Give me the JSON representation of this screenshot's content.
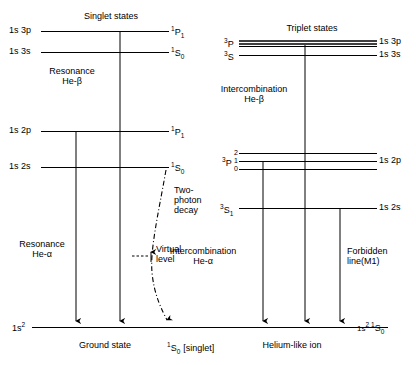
{
  "figure": {
    "type": "energy-level-diagram",
    "subject": "Helium-like ion",
    "columns": [
      {
        "name": "singlet",
        "heading": "Singlet states"
      },
      {
        "name": "triplet",
        "heading": "Triplet states"
      }
    ]
  },
  "headings": {
    "singlet": "Singlet states",
    "triplet": "Triplet states"
  },
  "singlet": {
    "levels": [
      {
        "config": "1s 3p",
        "term_main": "P",
        "term_pre": "1",
        "term_post": "1",
        "y": 31
      },
      {
        "config": "1s 3s",
        "term_main": "S",
        "term_pre": "1",
        "term_post": "0",
        "y": 52
      },
      {
        "config": "1s 2p",
        "term_main": "P",
        "term_pre": "1",
        "term_post": "1",
        "y": 131
      },
      {
        "config": "1s 2s",
        "term_main": "S",
        "term_pre": "1",
        "term_post": "0",
        "y": 167
      }
    ],
    "transitions": [
      {
        "name": "resonance-he-beta",
        "label_line1": "Resonance",
        "label_line2": "He-β"
      },
      {
        "name": "resonance-he-alpha",
        "label_line1": "Resonance",
        "label_line2": "He-α"
      },
      {
        "name": "two-photon-decay",
        "label_line1": "Two-",
        "label_line2": "photon",
        "label_line3": "decay"
      }
    ],
    "virtual_level": {
      "label_line1": "Virtual",
      "label_line2": "level"
    }
  },
  "triplet": {
    "levels": [
      {
        "term_main": "P",
        "term_pre": "3",
        "config": "1s 3p",
        "y": 43
      },
      {
        "term_main": "S",
        "term_pre": "3",
        "config": "1s 3s",
        "y": 55
      },
      {
        "config": "1s 2p",
        "term_main": "P",
        "term_pre": "3",
        "j_values": [
          "2",
          "1",
          "0"
        ],
        "y": 159
      },
      {
        "config": "1s 2s",
        "term_main": "S",
        "term_pre": "3",
        "term_post": "1",
        "y": 208
      }
    ],
    "transitions": [
      {
        "name": "intercombination-he-beta",
        "label_line1": "Intercombination",
        "label_line2": "He-β"
      },
      {
        "name": "intercombination-he-alpha",
        "label_line1": "Intercombination",
        "label_line2": "He-α"
      },
      {
        "name": "forbidden-line-m1",
        "label_line1": "Forbidden",
        "label_line2": "line(M1)"
      }
    ]
  },
  "ground": {
    "left_config": "1s",
    "left_config_sup": "2",
    "caption_singlet": "Ground state",
    "caption_singlet_term_pre": "1",
    "caption_singlet_term_main": "S",
    "caption_singlet_term_post": "0",
    "caption_singlet_note": "[singlet]",
    "caption_triplet": "Helium-like ion",
    "right_config": "1s",
    "right_config_sup": "2",
    "right_term_pre": "1",
    "right_term_main": "S",
    "right_term_post": "0"
  },
  "style": {
    "line_color": "#000000",
    "background": "#ffffff"
  }
}
